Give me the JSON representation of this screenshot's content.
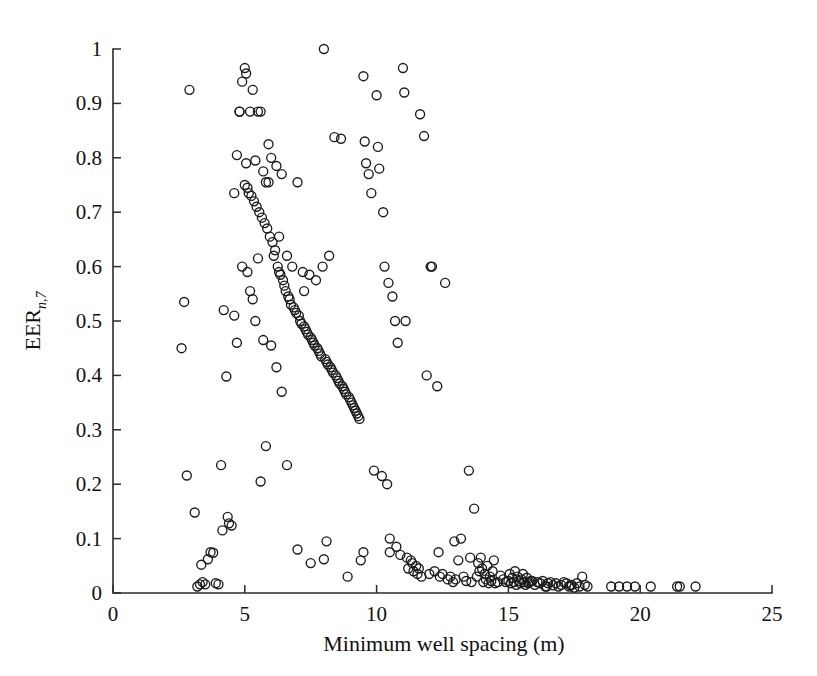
{
  "figure": {
    "background_color": "#ffffff",
    "ink_color": "#1b1b1b"
  },
  "chart_data": {
    "type": "scatter",
    "title": "",
    "subtitle": "",
    "xlabel": "Minimum well spacing (m)",
    "ylabel": "EER",
    "ylabel_subscript": "n,7",
    "xlim": [
      0,
      25
    ],
    "ylim": [
      0,
      1
    ],
    "xticks": [
      0,
      5,
      10,
      15,
      20,
      25
    ],
    "xticklabels": [
      "0",
      "5",
      "10",
      "15",
      "20",
      "25"
    ],
    "yticks": [
      0,
      0.1,
      0.2,
      0.3,
      0.4,
      0.5,
      0.6,
      0.7,
      0.8,
      0.9,
      1
    ],
    "yticklabels": [
      "0",
      "0.1",
      "0.2",
      "0.3",
      "0.4",
      "0.5",
      "0.6",
      "0.7",
      "0.8",
      "0.9",
      "1"
    ],
    "grid": false,
    "legend": null,
    "legend_position": "none",
    "marker": {
      "shape": "circle-open",
      "radius_px": 4.5,
      "stroke_color": "#1b1b1b",
      "stroke_width": 1.35,
      "fill": "none"
    },
    "annotations": [],
    "n_points": 268,
    "x": [
      2.9,
      2.6,
      2.7,
      2.8,
      3.1,
      3.2,
      3.4,
      3.5,
      3.6,
      3.7,
      3.8,
      3.9,
      4.0,
      4.1,
      4.2,
      4.3,
      4.4,
      4.5,
      4.6,
      4.6,
      4.7,
      4.7,
      4.8,
      4.8,
      4.9,
      4.9,
      5.0,
      5.0,
      5.05,
      5.1,
      5.1,
      5.15,
      5.2,
      5.2,
      5.25,
      5.3,
      5.3,
      5.35,
      5.4,
      5.4,
      5.45,
      5.5,
      5.5,
      5.55,
      5.6,
      5.6,
      5.65,
      5.7,
      5.7,
      5.75,
      5.8,
      5.8,
      5.85,
      5.9,
      5.95,
      6.0,
      6.0,
      6.05,
      6.1,
      6.15,
      6.2,
      6.2,
      6.25,
      6.3,
      6.35,
      6.4,
      6.4,
      6.45,
      6.5,
      6.55,
      6.6,
      6.6,
      6.65,
      6.7,
      6.75,
      6.8,
      6.85,
      6.9,
      6.95,
      7.0,
      7.0,
      7.05,
      7.1,
      7.15,
      7.2,
      7.25,
      7.3,
      7.35,
      7.4,
      7.45,
      7.5,
      7.5,
      7.55,
      7.6,
      7.65,
      7.7,
      7.75,
      7.8,
      7.85,
      7.9,
      7.95,
      8.0,
      8.0,
      8.05,
      8.1,
      8.15,
      8.2,
      8.25,
      8.3,
      8.35,
      8.4,
      8.45,
      8.5,
      8.55,
      8.6,
      8.65,
      8.7,
      8.75,
      8.8,
      8.85,
      8.9,
      8.95,
      9.0,
      9.05,
      9.1,
      9.15,
      9.2,
      9.25,
      9.3,
      9.35,
      9.4,
      9.5,
      9.55,
      9.6,
      9.7,
      9.8,
      9.9,
      10.0,
      10.05,
      10.1,
      10.2,
      10.25,
      10.3,
      10.4,
      10.45,
      10.5,
      10.6,
      10.7,
      10.75,
      10.8,
      10.9,
      11.0,
      11.05,
      11.1,
      11.15,
      11.2,
      11.3,
      11.35,
      11.4,
      11.5,
      11.6,
      11.65,
      11.7,
      11.8,
      11.9,
      12.0,
      12.05,
      12.1,
      12.2,
      12.3,
      12.4,
      12.5,
      12.6,
      12.7,
      12.8,
      12.9,
      13.0,
      13.1,
      13.2,
      13.3,
      13.4,
      13.5,
      13.6,
      13.7,
      13.8,
      13.85,
      13.9,
      13.95,
      14.0,
      14.05,
      14.1,
      14.15,
      14.2,
      14.25,
      14.3,
      14.35,
      14.4,
      14.5,
      14.6,
      14.7,
      14.8,
      14.9,
      15.0,
      15.05,
      15.1,
      15.15,
      15.2,
      15.25,
      15.3,
      15.35,
      15.4,
      15.45,
      15.5,
      15.55,
      15.6,
      15.65,
      15.7,
      15.75,
      15.8,
      15.9,
      16.0,
      16.1,
      16.2,
      16.3,
      16.4,
      16.5,
      16.6,
      16.7,
      16.8,
      16.9,
      17.0,
      17.1,
      17.2,
      17.3,
      17.4,
      17.5,
      17.6,
      17.7,
      17.8,
      17.9,
      18.0,
      18.9,
      19.2,
      19.5,
      19.8,
      20.4,
      21.4,
      21.5,
      22.1,
      3.3,
      3.35,
      4.15,
      4.35,
      5.05,
      5.9,
      6.3,
      7.25,
      8.1,
      9.5,
      10.5,
      11.55,
      12.35,
      13.55,
      14.45,
      15.85,
      16.45,
      17.35,
      12.95
    ],
    "y": [
      0.925,
      0.45,
      0.535,
      0.216,
      0.148,
      0.012,
      0.02,
      0.016,
      0.062,
      0.075,
      0.074,
      0.018,
      0.016,
      0.235,
      0.52,
      0.398,
      0.128,
      0.124,
      0.735,
      0.51,
      0.805,
      0.46,
      0.885,
      0.885,
      0.94,
      0.6,
      0.965,
      0.75,
      0.955,
      0.745,
      0.59,
      0.735,
      0.885,
      0.555,
      0.73,
      0.925,
      0.54,
      0.72,
      0.795,
      0.5,
      0.71,
      0.885,
      0.615,
      0.7,
      0.885,
      0.205,
      0.69,
      0.775,
      0.465,
      0.68,
      0.755,
      0.27,
      0.67,
      0.825,
      0.655,
      0.8,
      0.455,
      0.645,
      0.62,
      0.63,
      0.785,
      0.415,
      0.6,
      0.59,
      0.585,
      0.77,
      0.37,
      0.575,
      0.565,
      0.555,
      0.62,
      0.235,
      0.545,
      0.54,
      0.53,
      0.6,
      0.525,
      0.52,
      0.515,
      0.755,
      0.08,
      0.51,
      0.5,
      0.495,
      0.59,
      0.49,
      0.485,
      0.48,
      0.475,
      0.585,
      0.47,
      0.055,
      0.465,
      0.46,
      0.455,
      0.575,
      0.45,
      0.445,
      0.44,
      0.435,
      0.6,
      1.0,
      0.062,
      0.43,
      0.425,
      0.42,
      0.62,
      0.415,
      0.41,
      0.405,
      0.838,
      0.4,
      0.395,
      0.39,
      0.385,
      0.835,
      0.38,
      0.375,
      0.37,
      0.365,
      0.03,
      0.36,
      0.355,
      0.35,
      0.345,
      0.34,
      0.335,
      0.33,
      0.325,
      0.32,
      0.06,
      0.95,
      0.83,
      0.79,
      0.77,
      0.735,
      0.225,
      0.915,
      0.82,
      0.78,
      0.215,
      0.7,
      0.6,
      0.2,
      0.57,
      0.1,
      0.545,
      0.5,
      0.085,
      0.46,
      0.07,
      0.965,
      0.92,
      0.5,
      0.065,
      0.045,
      0.06,
      0.055,
      0.04,
      0.05,
      0.045,
      0.88,
      0.03,
      0.84,
      0.4,
      0.035,
      0.6,
      0.6,
      0.04,
      0.38,
      0.03,
      0.035,
      0.57,
      0.025,
      0.03,
      0.02,
      0.025,
      0.06,
      0.1,
      0.03,
      0.022,
      0.225,
      0.02,
      0.155,
      0.03,
      0.055,
      0.04,
      0.065,
      0.045,
      0.02,
      0.035,
      0.025,
      0.05,
      0.018,
      0.03,
      0.022,
      0.04,
      0.018,
      0.02,
      0.032,
      0.025,
      0.02,
      0.022,
      0.035,
      0.018,
      0.028,
      0.02,
      0.04,
      0.015,
      0.03,
      0.022,
      0.018,
      0.025,
      0.035,
      0.02,
      0.015,
      0.028,
      0.018,
      0.02,
      0.022,
      0.015,
      0.02,
      0.018,
      0.022,
      0.012,
      0.018,
      0.02,
      0.014,
      0.018,
      0.012,
      0.015,
      0.02,
      0.018,
      0.012,
      0.015,
      0.01,
      0.018,
      0.012,
      0.03,
      0.015,
      0.012,
      0.012,
      0.012,
      0.012,
      0.012,
      0.012,
      0.012,
      0.012,
      0.012,
      0.016,
      0.052,
      0.115,
      0.14,
      0.79,
      0.755,
      0.655,
      0.555,
      0.095,
      0.075,
      0.075,
      0.035,
      0.075,
      0.065,
      0.06,
      0.022,
      0.012,
      0.014,
      0.095
    ]
  },
  "axes": {
    "x_axis_name": "x-axis",
    "y_axis_name": "y-axis"
  }
}
